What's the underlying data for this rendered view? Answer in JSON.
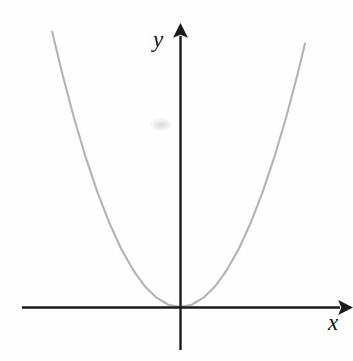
{
  "figure": {
    "background_color": "#fefefe",
    "axis_color": "#1a1a1a",
    "curve_color": "#b3b3b3",
    "label_color": "#111111",
    "y_axis_label": "y",
    "x_axis_label": "x",
    "artifact_note": ""
  },
  "chart_data": {
    "type": "line",
    "title": "",
    "subtitle": "",
    "xlabel": "x",
    "ylabel": "y",
    "function": "y = x^2",
    "grid": false,
    "legend": false,
    "legend_position": "none",
    "xlim": [
      -2.8,
      2.8
    ],
    "ylim": [
      -1.2,
      8.0
    ],
    "x_ticks": [],
    "y_ticks": [],
    "annotations": [],
    "series": [
      {
        "name": "y = x^2",
        "color": "#b3b3b3",
        "x": [
          -2.72,
          -2.5,
          -2.25,
          -2.0,
          -1.75,
          -1.5,
          -1.25,
          -1.0,
          -0.75,
          -0.5,
          -0.25,
          0.0,
          0.25,
          0.5,
          0.75,
          1.0,
          1.25,
          1.5,
          1.75,
          2.0,
          2.25,
          2.5,
          2.66
        ],
        "values": [
          7.4,
          6.25,
          5.06,
          4.0,
          3.06,
          2.25,
          1.56,
          1.0,
          0.56,
          0.25,
          0.06,
          0.0,
          0.06,
          0.25,
          0.56,
          1.0,
          1.56,
          2.25,
          3.06,
          4.0,
          5.06,
          6.25,
          7.08
        ]
      }
    ],
    "axes": {
      "x_axis": {
        "from": [
          -3.35,
          0
        ],
        "to": [
          3.5,
          0
        ],
        "arrow": "end"
      },
      "y_axis": {
        "from": [
          0,
          -1.2
        ],
        "to": [
          0,
          7.9
        ],
        "arrow": "end"
      }
    }
  }
}
